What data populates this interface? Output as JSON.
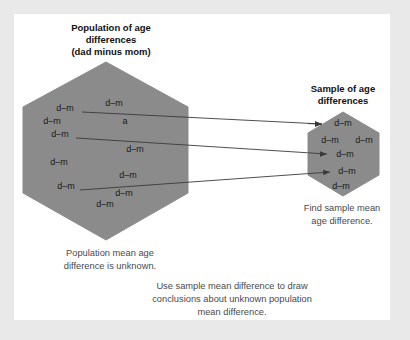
{
  "figure": {
    "background_color": "#e9e9e9",
    "card_color": "#ffffff",
    "hex_fill": "#8b8b8b"
  },
  "population": {
    "heading_line1": "Population of age",
    "heading_line2": "differences",
    "heading_line3": "(dad minus mom)",
    "items": [
      {
        "label": "d–m",
        "x": 65,
        "y": 111
      },
      {
        "label": "d–m",
        "x": 114,
        "y": 106
      },
      {
        "label": "d–m",
        "x": 52,
        "y": 124
      },
      {
        "label": "a",
        "x": 125,
        "y": 124
      },
      {
        "label": "d–m",
        "x": 60,
        "y": 137
      },
      {
        "label": "d–m",
        "x": 135,
        "y": 152
      },
      {
        "label": "d–m",
        "x": 59,
        "y": 165
      },
      {
        "label": "d–m",
        "x": 128,
        "y": 178
      },
      {
        "label": "d–m",
        "x": 66,
        "y": 189
      },
      {
        "label": "d–m",
        "x": 124,
        "y": 196
      },
      {
        "label": "d–m",
        "x": 105,
        "y": 207
      }
    ],
    "caption_line1": "Population mean age",
    "caption_line2": "difference is unknown."
  },
  "sample": {
    "heading_line1": "Sample of age",
    "heading_line2": "differences",
    "items": [
      {
        "label": "d–m",
        "x": 343,
        "y": 126
      },
      {
        "label": "d–m",
        "x": 330,
        "y": 143
      },
      {
        "label": "d–m",
        "x": 364,
        "y": 143
      },
      {
        "label": "d–m",
        "x": 345,
        "y": 157
      },
      {
        "label": "d–m",
        "x": 347,
        "y": 174
      },
      {
        "label": "d–m",
        "x": 341,
        "y": 189
      }
    ],
    "caption_line1": "Find sample mean",
    "caption_line2": "age difference."
  },
  "conclusion": {
    "line1": "Use sample mean difference to draw",
    "line2": "conclusions about unknown population",
    "line3": "mean difference."
  },
  "arrows": [
    {
      "name": "sampling-arrow-1",
      "x1": 82,
      "y1": 112,
      "x2": 323,
      "y2": 124
    },
    {
      "name": "sampling-arrow-2",
      "x1": 76,
      "y1": 138,
      "x2": 328,
      "y2": 154
    },
    {
      "name": "sampling-arrow-3",
      "x1": 80,
      "y1": 190,
      "x2": 330,
      "y2": 172
    }
  ]
}
